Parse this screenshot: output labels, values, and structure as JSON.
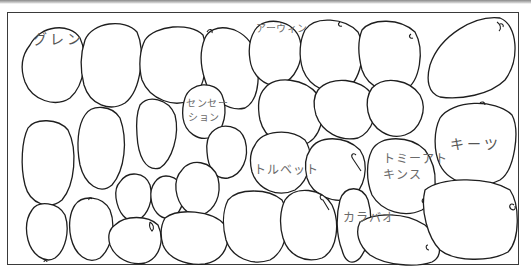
{
  "diagram": {
    "type": "illustration",
    "line_color": "#1e1e1e",
    "label_color": "#6a6a6a",
    "labels": [
      {
        "id": "glenn",
        "text": "グレン"
      },
      {
        "id": "sensation_1",
        "text": "センセー"
      },
      {
        "id": "sensation_2",
        "text": "ション"
      },
      {
        "id": "irwin",
        "text": "アーウィン"
      },
      {
        "id": "kent_label",
        "text": "キーツ"
      },
      {
        "id": "tolbert",
        "text": "トルベット"
      },
      {
        "id": "tommy_1",
        "text": "トミーアト"
      },
      {
        "id": "tommy_2",
        "text": "キンス"
      },
      {
        "id": "carabao",
        "text": "カラバオ"
      }
    ]
  }
}
